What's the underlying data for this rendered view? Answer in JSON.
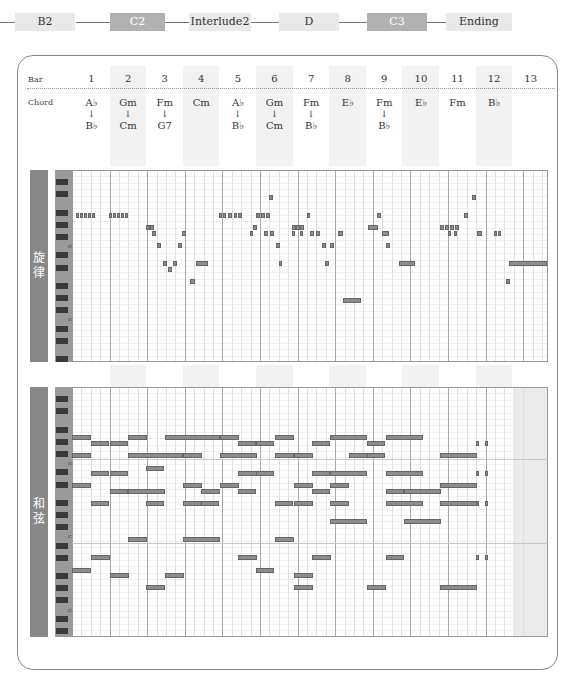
{
  "sections": [
    {
      "label": "B2",
      "style": "light",
      "x": 42,
      "w": 60
    },
    {
      "label": "C2",
      "style": "dark",
      "x": 110,
      "w": 55
    },
    {
      "label": "Interlude2",
      "style": "light",
      "x": 189,
      "w": 62
    },
    {
      "label": "D",
      "style": "light",
      "x": 279,
      "w": 60
    },
    {
      "label": "C3",
      "style": "dark",
      "x": 367,
      "w": 60
    },
    {
      "label": "Ending",
      "style": "light",
      "x": 446,
      "w": 66
    }
  ],
  "header": {
    "bar_label": "Bar",
    "chord_label": "Chord",
    "bars": [
      "1",
      "2",
      "3",
      "4",
      "5",
      "6",
      "7",
      "8",
      "9",
      "10",
      "11",
      "12",
      "13"
    ],
    "chords": [
      {
        "top": "A♭",
        "bottom": "B♭"
      },
      {
        "top": "Gm",
        "bottom": "Cm"
      },
      {
        "top": "Fm",
        "bottom": "G7"
      },
      {
        "top": "Cm",
        "bottom": ""
      },
      {
        "top": "A♭",
        "bottom": "B♭"
      },
      {
        "top": "Gm",
        "bottom": "Cm"
      },
      {
        "top": "Fm",
        "bottom": "B♭"
      },
      {
        "top": "E♭",
        "bottom": ""
      },
      {
        "top": "Fm",
        "bottom": "B♭"
      },
      {
        "top": "E♭",
        "bottom": ""
      },
      {
        "top": "Fm",
        "bottom": ""
      },
      {
        "top": "B♭",
        "bottom": ""
      },
      {
        "top": "",
        "bottom": ""
      }
    ],
    "arrow": "↓"
  },
  "melody": {
    "label": "旋律",
    "octave_labels": [
      "C5",
      "C4"
    ],
    "notes": [
      [
        76,
        213,
        3
      ],
      [
        80,
        213,
        3
      ],
      [
        84,
        213,
        3
      ],
      [
        88,
        213,
        3
      ],
      [
        92,
        213,
        3
      ],
      [
        109,
        213,
        3
      ],
      [
        113,
        213,
        3
      ],
      [
        117,
        213,
        3
      ],
      [
        121,
        213,
        3
      ],
      [
        125,
        213,
        3
      ],
      [
        146,
        225,
        4
      ],
      [
        150,
        225,
        4
      ],
      [
        152,
        231,
        4
      ],
      [
        157,
        243,
        4
      ],
      [
        163,
        261,
        4
      ],
      [
        168,
        267,
        4
      ],
      [
        173,
        261,
        4
      ],
      [
        178,
        243,
        4
      ],
      [
        182,
        231,
        4
      ],
      [
        196,
        261,
        12
      ],
      [
        190,
        279,
        5
      ],
      [
        219,
        213,
        3
      ],
      [
        223,
        213,
        3
      ],
      [
        228,
        213,
        4
      ],
      [
        234,
        213,
        3
      ],
      [
        238,
        213,
        4
      ],
      [
        253,
        225,
        4
      ],
      [
        250,
        231,
        3
      ],
      [
        256,
        213,
        4
      ],
      [
        261,
        213,
        4
      ],
      [
        266,
        213,
        4
      ],
      [
        269,
        195,
        4
      ],
      [
        264,
        231,
        4
      ],
      [
        270,
        231,
        4
      ],
      [
        276,
        243,
        4
      ],
      [
        279,
        261,
        3
      ],
      [
        292,
        225,
        4
      ],
      [
        296,
        225,
        4
      ],
      [
        300,
        225,
        4
      ],
      [
        292,
        231,
        3
      ],
      [
        300,
        231,
        3
      ],
      [
        307,
        213,
        3
      ],
      [
        310,
        231,
        4
      ],
      [
        316,
        231,
        4
      ],
      [
        322,
        243,
        4
      ],
      [
        325,
        261,
        4
      ],
      [
        330,
        243,
        4
      ],
      [
        338,
        231,
        5
      ],
      [
        343,
        298,
        18
      ],
      [
        368,
        225,
        10
      ],
      [
        377,
        213,
        4
      ],
      [
        382,
        231,
        7
      ],
      [
        386,
        243,
        4
      ],
      [
        399,
        261,
        16
      ],
      [
        440,
        225,
        4
      ],
      [
        445,
        225,
        4
      ],
      [
        450,
        225,
        4
      ],
      [
        455,
        225,
        4
      ],
      [
        448,
        231,
        3
      ],
      [
        454,
        231,
        3
      ],
      [
        464,
        213,
        4
      ],
      [
        472,
        195,
        4
      ],
      [
        477,
        231,
        5
      ],
      [
        494,
        231,
        3
      ],
      [
        498,
        231,
        3
      ],
      [
        506,
        279,
        4
      ],
      [
        509,
        261,
        38
      ]
    ]
  },
  "harmony": {
    "label": "和弦",
    "octave_labels": [
      "C4",
      "C3",
      "C2"
    ],
    "notes": [
      [
        72,
        435,
        19
      ],
      [
        91,
        441,
        18
      ],
      [
        110,
        441,
        18
      ],
      [
        128,
        435,
        19
      ],
      [
        165,
        435,
        55
      ],
      [
        220,
        435,
        19
      ],
      [
        238,
        441,
        18
      ],
      [
        256,
        441,
        18
      ],
      [
        275,
        435,
        19
      ],
      [
        312,
        441,
        18
      ],
      [
        330,
        435,
        37
      ],
      [
        367,
        441,
        18
      ],
      [
        386,
        435,
        37
      ],
      [
        476,
        441,
        3
      ],
      [
        485,
        441,
        3
      ],
      [
        72,
        453,
        19
      ],
      [
        128,
        453,
        55
      ],
      [
        183,
        453,
        19
      ],
      [
        220,
        453,
        37
      ],
      [
        275,
        453,
        19
      ],
      [
        294,
        453,
        19
      ],
      [
        349,
        453,
        19
      ],
      [
        367,
        453,
        18
      ],
      [
        440,
        453,
        37
      ],
      [
        91,
        471,
        18
      ],
      [
        110,
        471,
        18
      ],
      [
        146,
        466,
        18
      ],
      [
        238,
        471,
        19
      ],
      [
        256,
        471,
        18
      ],
      [
        312,
        471,
        18
      ],
      [
        330,
        471,
        37
      ],
      [
        386,
        471,
        37
      ],
      [
        476,
        471,
        3
      ],
      [
        485,
        471,
        3
      ],
      [
        72,
        483,
        19
      ],
      [
        110,
        489,
        18
      ],
      [
        128,
        489,
        37
      ],
      [
        183,
        483,
        19
      ],
      [
        201,
        489,
        19
      ],
      [
        220,
        483,
        19
      ],
      [
        238,
        489,
        18
      ],
      [
        294,
        483,
        19
      ],
      [
        312,
        489,
        18
      ],
      [
        330,
        483,
        19
      ],
      [
        386,
        489,
        18
      ],
      [
        404,
        489,
        37
      ],
      [
        440,
        483,
        37
      ],
      [
        91,
        501,
        18
      ],
      [
        146,
        501,
        18
      ],
      [
        183,
        501,
        19
      ],
      [
        201,
        501,
        18
      ],
      [
        275,
        501,
        18
      ],
      [
        294,
        501,
        19
      ],
      [
        330,
        501,
        19
      ],
      [
        386,
        501,
        37
      ],
      [
        440,
        501,
        37
      ],
      [
        476,
        501,
        3
      ],
      [
        485,
        501,
        3
      ],
      [
        330,
        519,
        37
      ],
      [
        404,
        519,
        37
      ],
      [
        128,
        537,
        19
      ],
      [
        183,
        537,
        37
      ],
      [
        275,
        537,
        19
      ],
      [
        91,
        555,
        19
      ],
      [
        238,
        555,
        19
      ],
      [
        312,
        555,
        19
      ],
      [
        386,
        555,
        18
      ],
      [
        476,
        555,
        3
      ],
      [
        485,
        555,
        3
      ],
      [
        72,
        568,
        19
      ],
      [
        256,
        568,
        18
      ],
      [
        110,
        573,
        19
      ],
      [
        165,
        573,
        19
      ],
      [
        294,
        573,
        19
      ],
      [
        146,
        585,
        19
      ],
      [
        294,
        585,
        19
      ],
      [
        367,
        585,
        19
      ],
      [
        440,
        585,
        37
      ]
    ]
  }
}
